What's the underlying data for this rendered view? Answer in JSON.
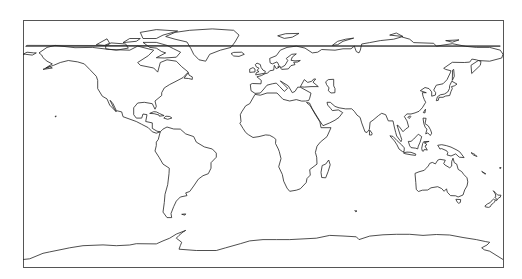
{
  "map": {
    "projection": "PlateCarree",
    "feature": "coastlines",
    "frame": {
      "x": 23,
      "y": 20,
      "width": 480,
      "height": 247
    },
    "colors": {
      "background": "#ffffff",
      "coastline": "#222222",
      "frame": "#555555"
    },
    "extent": {
      "lon_min": -180,
      "lon_max": 180,
      "lat_min": -90,
      "lat_max": 90
    },
    "landmasses": [
      "north-america",
      "greenland",
      "south-america",
      "europe-asia",
      "africa",
      "madagascar",
      "arabia",
      "india",
      "southeast-asia",
      "japan",
      "australia",
      "new-zealand",
      "antarctica",
      "british-isles",
      "iceland",
      "indonesia",
      "caribbean"
    ]
  }
}
